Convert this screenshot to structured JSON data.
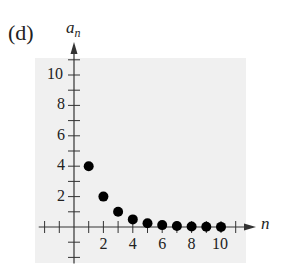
{
  "panel_label": "(d)",
  "chart_data": {
    "type": "scatter",
    "title": "",
    "xlabel": "n",
    "ylabel": "a_n",
    "x": [
      1,
      2,
      3,
      4,
      5,
      6,
      7,
      8,
      9,
      10
    ],
    "values": [
      4,
      2,
      1,
      0.5,
      0.25,
      0.125,
      0.0625,
      0.03125,
      0.015625,
      0.0078125
    ],
    "xlim": [
      -2,
      11
    ],
    "ylim": [
      -2,
      11
    ],
    "x_ticks_labeled": [
      2,
      4,
      6,
      8,
      10
    ],
    "y_ticks_labeled": [
      2,
      4,
      6,
      8,
      10
    ],
    "grid": false,
    "background": "#f0f0f0",
    "point_color": "#000000"
  }
}
